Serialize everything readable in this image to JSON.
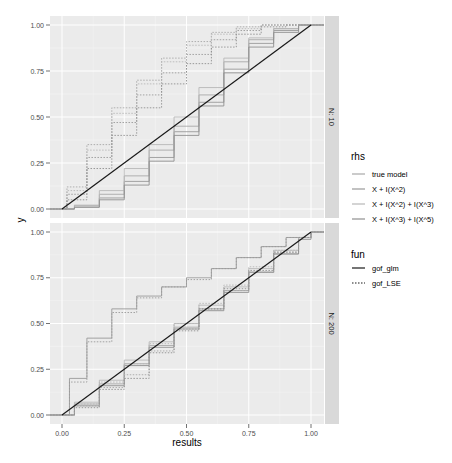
{
  "chart_data": {
    "type": "line",
    "subtype": "step-ecdf-facet",
    "xlabel": "results",
    "ylabel": "y",
    "xlim": [
      0,
      1
    ],
    "ylim": [
      0,
      1
    ],
    "x_ticks": [
      "0.00",
      "0.25",
      "0.50",
      "0.75",
      "1.00"
    ],
    "y_ticks": [
      "0.00",
      "0.25",
      "0.50",
      "0.75",
      "1.00"
    ],
    "grid": true,
    "legend_position": "right",
    "facets": [
      {
        "label": "N: 10",
        "series": [
          {
            "rhs": "true model",
            "fun": "gof_glm",
            "x": [
              0,
              0.05,
              0.15,
              0.25,
              0.35,
              0.45,
              0.55,
              0.65,
              0.75,
              0.85,
              0.95,
              1
            ],
            "y": [
              0,
              0.02,
              0.08,
              0.18,
              0.32,
              0.45,
              0.62,
              0.8,
              0.92,
              0.98,
              1,
              1
            ]
          },
          {
            "rhs": "X + I(X^2)",
            "fun": "gof_glm",
            "x": [
              0,
              0.05,
              0.15,
              0.25,
              0.35,
              0.45,
              0.55,
              0.65,
              0.75,
              0.85,
              0.95,
              1
            ],
            "y": [
              0,
              0.01,
              0.06,
              0.15,
              0.28,
              0.42,
              0.58,
              0.76,
              0.9,
              0.97,
              1,
              1
            ]
          },
          {
            "rhs": "X + I(X^2) + I(X^3)",
            "fun": "gof_glm",
            "x": [
              0,
              0.05,
              0.15,
              0.25,
              0.35,
              0.45,
              0.55,
              0.65,
              0.75,
              0.85,
              0.95,
              1
            ],
            "y": [
              0,
              0.02,
              0.1,
              0.22,
              0.35,
              0.5,
              0.66,
              0.82,
              0.93,
              0.98,
              1,
              1
            ]
          },
          {
            "rhs": "X + I(X^3) + I(X^5)",
            "fun": "gof_glm",
            "x": [
              0,
              0.05,
              0.15,
              0.25,
              0.35,
              0.45,
              0.55,
              0.65,
              0.75,
              0.85,
              0.95,
              1
            ],
            "y": [
              0,
              0.01,
              0.05,
              0.13,
              0.26,
              0.4,
              0.56,
              0.74,
              0.88,
              0.96,
              1,
              1
            ]
          },
          {
            "rhs": "true model",
            "fun": "gof_LSE",
            "x": [
              0,
              0.02,
              0.1,
              0.2,
              0.3,
              0.4,
              0.5,
              0.6,
              0.7,
              0.8,
              0.9,
              1
            ],
            "y": [
              0,
              0.12,
              0.35,
              0.55,
              0.7,
              0.82,
              0.91,
              0.96,
              0.99,
              1,
              1,
              1
            ]
          },
          {
            "rhs": "X + I(X^2)",
            "fun": "gof_LSE",
            "x": [
              0,
              0.02,
              0.1,
              0.2,
              0.3,
              0.4,
              0.5,
              0.6,
              0.7,
              0.8,
              0.9,
              1
            ],
            "y": [
              0,
              0.08,
              0.28,
              0.47,
              0.62,
              0.74,
              0.84,
              0.92,
              0.97,
              1,
              1,
              1
            ]
          },
          {
            "rhs": "X + I(X^2) + I(X^3)",
            "fun": "gof_LSE",
            "x": [
              0,
              0.02,
              0.1,
              0.2,
              0.3,
              0.4,
              0.5,
              0.6,
              0.7,
              0.8,
              0.9,
              1
            ],
            "y": [
              0,
              0.1,
              0.32,
              0.52,
              0.68,
              0.8,
              0.89,
              0.95,
              0.98,
              1,
              1,
              1
            ]
          },
          {
            "rhs": "X + I(X^3) + I(X^5)",
            "fun": "gof_LSE",
            "x": [
              0,
              0.02,
              0.1,
              0.2,
              0.3,
              0.4,
              0.5,
              0.6,
              0.7,
              0.8,
              0.9,
              1
            ],
            "y": [
              0,
              0.05,
              0.22,
              0.4,
              0.55,
              0.68,
              0.79,
              0.88,
              0.95,
              0.99,
              1,
              1
            ]
          },
          {
            "rhs": "reference",
            "fun": "gof_glm",
            "x": [
              0,
              1
            ],
            "y": [
              0,
              1
            ]
          }
        ]
      },
      {
        "label": "N: 200",
        "series": [
          {
            "rhs": "true model",
            "fun": "gof_glm",
            "x": [
              0,
              0.05,
              0.15,
              0.25,
              0.35,
              0.45,
              0.55,
              0.65,
              0.75,
              0.85,
              0.95,
              1
            ],
            "y": [
              0,
              0.06,
              0.17,
              0.28,
              0.38,
              0.48,
              0.58,
              0.68,
              0.78,
              0.88,
              0.97,
              1
            ]
          },
          {
            "rhs": "X + I(X^2)",
            "fun": "gof_glm",
            "x": [
              0,
              0.03,
              0.1,
              0.2,
              0.3,
              0.4,
              0.5,
              0.6,
              0.7,
              0.8,
              0.9,
              1
            ],
            "y": [
              0,
              0.2,
              0.42,
              0.58,
              0.65,
              0.7,
              0.75,
              0.8,
              0.86,
              0.92,
              0.97,
              1
            ]
          },
          {
            "rhs": "X + I(X^2) + I(X^3)",
            "fun": "gof_glm",
            "x": [
              0,
              0.05,
              0.15,
              0.25,
              0.35,
              0.45,
              0.55,
              0.65,
              0.75,
              0.85,
              0.95,
              1
            ],
            "y": [
              0,
              0.07,
              0.19,
              0.3,
              0.4,
              0.5,
              0.6,
              0.7,
              0.8,
              0.9,
              0.97,
              1
            ]
          },
          {
            "rhs": "X + I(X^3) + I(X^5)",
            "fun": "gof_glm",
            "x": [
              0,
              0.05,
              0.15,
              0.25,
              0.35,
              0.45,
              0.55,
              0.65,
              0.75,
              0.85,
              0.95,
              1
            ],
            "y": [
              0,
              0.05,
              0.16,
              0.27,
              0.37,
              0.47,
              0.57,
              0.67,
              0.78,
              0.88,
              0.96,
              1
            ]
          },
          {
            "rhs": "true model",
            "fun": "gof_LSE",
            "x": [
              0,
              0.05,
              0.15,
              0.25,
              0.35,
              0.45,
              0.55,
              0.65,
              0.75,
              0.85,
              0.95,
              1
            ],
            "y": [
              0,
              0.05,
              0.15,
              0.22,
              0.35,
              0.47,
              0.58,
              0.68,
              0.78,
              0.89,
              0.97,
              1
            ]
          },
          {
            "rhs": "X + I(X^2)",
            "fun": "gof_LSE",
            "x": [
              0,
              0.03,
              0.1,
              0.2,
              0.3,
              0.4,
              0.5,
              0.6,
              0.7,
              0.8,
              0.9,
              1
            ],
            "y": [
              0,
              0.18,
              0.4,
              0.56,
              0.64,
              0.7,
              0.74,
              0.8,
              0.86,
              0.92,
              0.97,
              1
            ]
          },
          {
            "rhs": "X + I(X^2) + I(X^3)",
            "fun": "gof_LSE",
            "x": [
              0,
              0.05,
              0.15,
              0.25,
              0.35,
              0.45,
              0.55,
              0.65,
              0.75,
              0.85,
              0.95,
              1
            ],
            "y": [
              0,
              0.06,
              0.18,
              0.28,
              0.39,
              0.5,
              0.61,
              0.71,
              0.81,
              0.9,
              0.97,
              1
            ]
          },
          {
            "rhs": "X + I(X^3) + I(X^5)",
            "fun": "gof_LSE",
            "x": [
              0,
              0.05,
              0.15,
              0.25,
              0.35,
              0.45,
              0.55,
              0.65,
              0.75,
              0.85,
              0.95,
              1
            ],
            "y": [
              0,
              0.04,
              0.14,
              0.2,
              0.34,
              0.46,
              0.58,
              0.69,
              0.79,
              0.89,
              0.97,
              1
            ]
          },
          {
            "rhs": "reference",
            "fun": "gof_glm",
            "x": [
              0,
              1
            ],
            "y": [
              0,
              1
            ]
          }
        ]
      }
    ],
    "legends": [
      {
        "title": "rhs",
        "entries": [
          "true model",
          "X + I(X^2)",
          "X + I(X^2) + I(X^3)",
          "X + I(X^3) + I(X^5)"
        ]
      },
      {
        "title": "fun",
        "entries": [
          "gof_glm",
          "gof_LSE"
        ]
      }
    ]
  },
  "axes": {
    "xlabel": "results",
    "ylabel": "y",
    "x_ticks": [
      "0.00",
      "0.25",
      "0.50",
      "0.75",
      "1.00"
    ],
    "y_ticks": [
      "0.00",
      "0.25",
      "0.50",
      "0.75",
      "1.00"
    ]
  },
  "facets": [
    {
      "label": "N: 10"
    },
    {
      "label": "N: 200"
    }
  ],
  "legend": {
    "rhs": {
      "title": "rhs",
      "items": [
        "true model",
        "X + I(X^2)",
        "X + I(X^2) + I(X^3)",
        "X + I(X^3) + I(X^5)"
      ],
      "colors": [
        "#a8a8a8",
        "#9a9a9a",
        "#b8b8b8",
        "#909090"
      ]
    },
    "fun": {
      "title": "fun",
      "items": [
        "gof_glm",
        "gof_LSE"
      ]
    }
  },
  "colors": {
    "panel_bg": "#ebebeb",
    "grid_major": "#ffffff",
    "strip_bg": "#d9d9d9",
    "reference_line": "#1a1a1a"
  }
}
